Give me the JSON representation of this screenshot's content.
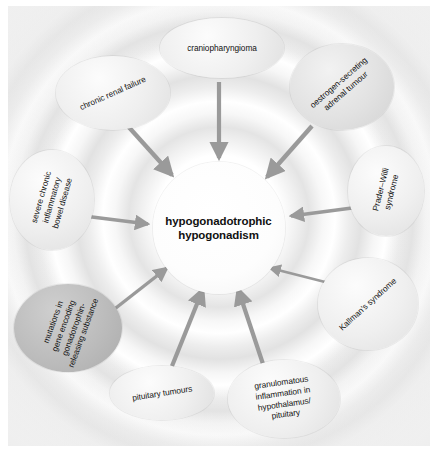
{
  "diagram": {
    "type": "radial-cause-diagram",
    "center": {
      "label": "hypogonadotrophic\nhypogonadism"
    },
    "arrow_color": "#9a9a9a",
    "nodes": [
      {
        "id": "craniopharyngioma",
        "label": "craniopharyngioma",
        "tone": "light"
      },
      {
        "id": "oestrogen-secreting-adrenal-tumour",
        "label": "oestrogen-secreting\nadrenal tumour",
        "tone": "mid"
      },
      {
        "id": "prader-willi-syndrome",
        "label": "Prader–Willi\nsyndrome",
        "tone": "light"
      },
      {
        "id": "kallmans-syndrome",
        "label": "Kallman's syndrome",
        "tone": "light"
      },
      {
        "id": "granulomatous-inflammation",
        "label": "granulomatous\ninflammation in\nhypothalamus/\npituitary",
        "tone": "light"
      },
      {
        "id": "pituitary-tumours",
        "label": "pituitary tumours",
        "tone": "light"
      },
      {
        "id": "gnrh-gene-mutations",
        "label": "mutations in\ngene encoding\ngonadotrophin-\nreleasing substance",
        "tone": "dark"
      },
      {
        "id": "severe-chronic-ibd",
        "label": "severe chronic\ninflammatory\nbowel disease",
        "tone": "light"
      },
      {
        "id": "chronic-renal-failure",
        "label": "chronic renal failure",
        "tone": "light"
      }
    ]
  }
}
